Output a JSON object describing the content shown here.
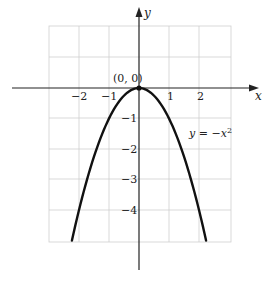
{
  "chart_data": {
    "type": "line",
    "title": "",
    "xlabel": "x",
    "ylabel": "y",
    "xlim": [
      -3,
      3
    ],
    "ylim": [
      -5,
      2
    ],
    "grid": true,
    "x_ticks": [
      {
        "value": -2,
        "label": "−2"
      },
      {
        "value": -1,
        "label": "−1"
      },
      {
        "value": 1,
        "label": "1"
      },
      {
        "value": 2,
        "label": "2"
      }
    ],
    "y_ticks": [
      {
        "value": -1,
        "label": "−1"
      },
      {
        "value": -2,
        "label": "−2"
      },
      {
        "value": -3,
        "label": "−3"
      },
      {
        "value": -4,
        "label": "−4"
      }
    ],
    "series": [
      {
        "name": "y = −x²",
        "function": "y = -x^2",
        "x": [
          -2.236,
          -2,
          -1.5,
          -1,
          -0.5,
          0,
          0.5,
          1,
          1.5,
          2,
          2.236
        ],
        "y": [
          -5,
          -4,
          -2.25,
          -1,
          -0.25,
          0,
          -0.25,
          -1,
          -2.25,
          -4,
          -5
        ],
        "color": "#111111"
      }
    ],
    "annotations": [
      {
        "text": "(0, 0)",
        "x": 0,
        "y": 0,
        "marker": "point"
      },
      {
        "text": "y = −x²",
        "x": 1.6,
        "y": -1.5
      }
    ]
  },
  "labels": {
    "x_axis": "x",
    "y_axis": "y",
    "origin_point": "(0, 0)",
    "equation": "y = −x²",
    "x_tick_m2": "−2",
    "x_tick_m1": "−1",
    "x_tick_1": "1",
    "x_tick_2": "2",
    "y_tick_m1": "−1",
    "y_tick_m2": "−2",
    "y_tick_m3": "−3",
    "y_tick_m4": "−4"
  }
}
